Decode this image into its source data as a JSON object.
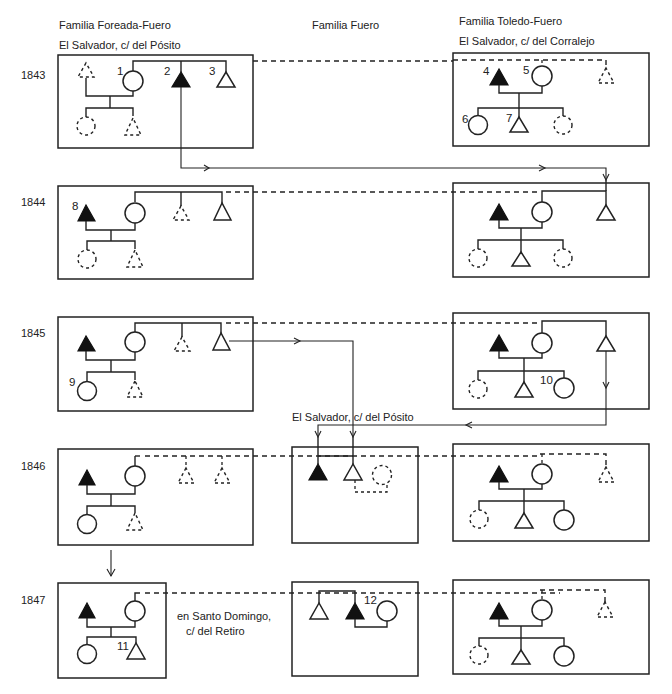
{
  "diagram": {
    "type": "kinship household diagram over time",
    "columns": [
      {
        "id": "foreada",
        "title": "Familia Foreada-Fuero",
        "address": "El Salvador, c/ del Pósito"
      },
      {
        "id": "fuero",
        "title": "Familia Fuero",
        "address_1846": "El Salvador, c/ del Pósito"
      },
      {
        "id": "toledo",
        "title": "Familia Toledo-Fuero",
        "address": "El Salvador, c/ del Corralejo"
      }
    ],
    "years": [
      "1843",
      "1844",
      "1845",
      "1846",
      "1847"
    ],
    "annotations": {
      "santo_domingo_1": "en Santo Domingo,",
      "santo_domingo_2": "c/ del Retiro"
    },
    "person_numbers": [
      "1",
      "2",
      "3",
      "4",
      "5",
      "6",
      "7",
      "8",
      "9",
      "10",
      "11",
      "12"
    ],
    "legend": {
      "open_triangle": "male",
      "filled_triangle": "male (deceased / emphasized)",
      "open_circle": "female",
      "dashed_symbol": "absent / not resident"
    }
  }
}
